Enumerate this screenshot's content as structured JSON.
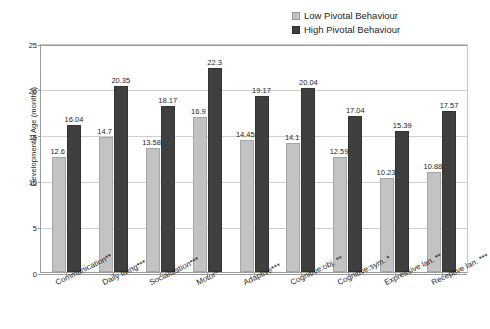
{
  "chart_data": {
    "type": "bar",
    "title": "",
    "xlabel": "",
    "ylabel": "Developmental Age (months)",
    "ylim": [
      0,
      25
    ],
    "yticks": [
      "0",
      "5",
      "10",
      "15",
      "20",
      "25"
    ],
    "grid": true,
    "legend_position": "top-right",
    "categories": [
      "Communication**",
      "Daily living***",
      "Socialization***",
      "Motor*",
      "Adaptive***",
      "Cognitive:obj. **",
      "Cognitive:sym. *",
      "Expressive lan. **",
      "Receptive lan. ***"
    ],
    "series": [
      {
        "name": "Low Pivotal Behaviour",
        "color": "#c3c3c3",
        "values": [
          12.6,
          14.7,
          13.58,
          16.9,
          14.45,
          14.1,
          12.59,
          10.23,
          10.88
        ],
        "labels": [
          "12.6",
          "14.7",
          "13.58",
          "16.9",
          "14.45",
          "14.1",
          "12.59",
          "10.23",
          "10.88"
        ]
      },
      {
        "name": "High Pivotal Behaviour",
        "color": "#3f3f3f",
        "values": [
          16.04,
          20.35,
          18.17,
          22.3,
          19.17,
          20.04,
          17.04,
          15.39,
          17.57
        ],
        "labels": [
          "16.04",
          "20.35",
          "18.17",
          "22.3",
          "19.17",
          "20.04",
          "17.04",
          "15.39",
          "17.57"
        ]
      }
    ]
  },
  "legend": {
    "items": [
      {
        "label": "Low Pivotal Behaviour",
        "swatch": "low"
      },
      {
        "label": "High Pivotal Behaviour",
        "swatch": "high"
      }
    ]
  },
  "colors": {
    "low_series": "#c3c3c3",
    "high_series": "#3f3f3f",
    "gridline": "#cfcfcf",
    "axis": "#9c9c9c",
    "background": "#ffffff"
  }
}
